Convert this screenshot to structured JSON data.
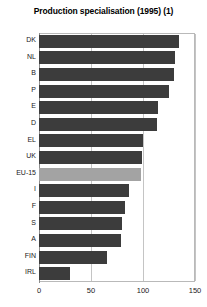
{
  "chart_data": {
    "type": "bar",
    "orientation": "horizontal",
    "title": "Production specialisation (1995) (1)",
    "xlabel": "",
    "ylabel": "",
    "xlim": [
      0,
      150
    ],
    "xticks": [
      0,
      50,
      100,
      150
    ],
    "grid": true,
    "legend": null,
    "categories": [
      "DK",
      "NL",
      "B",
      "P",
      "E",
      "D",
      "EL",
      "UK",
      "EU-15",
      "I",
      "F",
      "S",
      "A",
      "FIN",
      "IRL"
    ],
    "values": [
      135,
      131,
      130,
      125,
      114,
      113,
      100,
      99,
      98,
      87,
      83,
      80,
      79,
      65,
      30
    ],
    "highlight_category": "EU-15",
    "colors": {
      "bar": "#3c3c3c",
      "bar_highlight": "#a3a3a3",
      "grid": "#c4c4c4",
      "frame": "#b9b9b9",
      "text": "#1a1a1a",
      "background": "#ffffff"
    }
  }
}
